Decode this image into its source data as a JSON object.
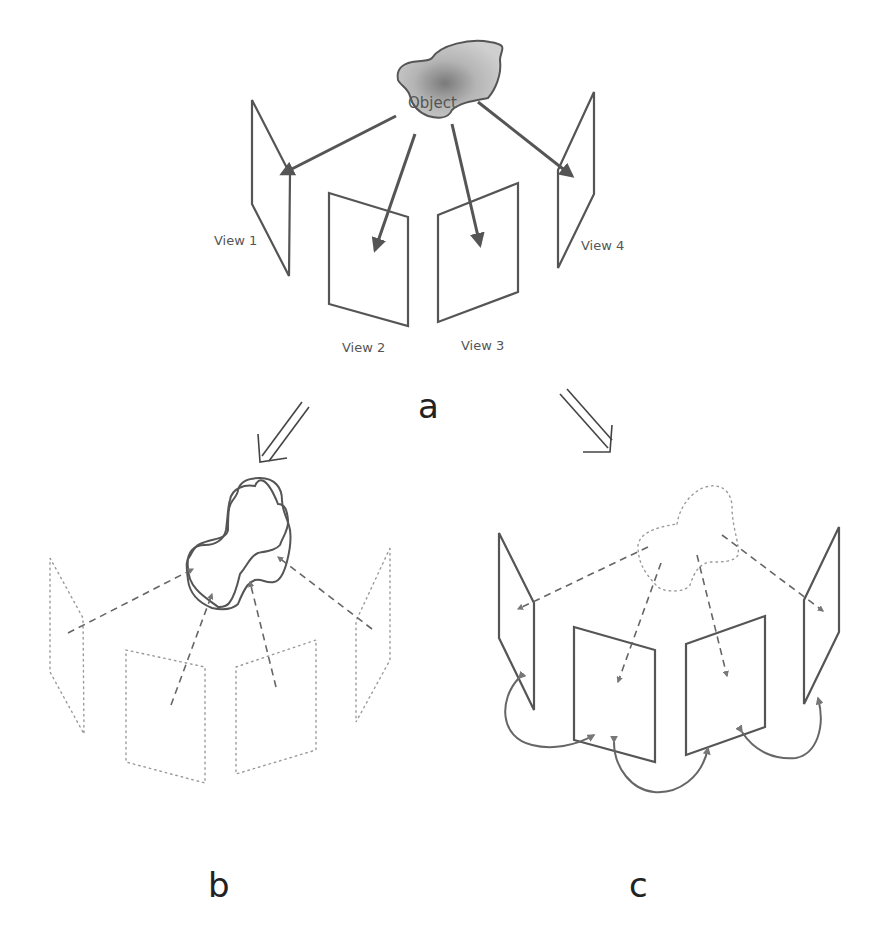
{
  "panels": {
    "a": {
      "label": "a",
      "object_label": "Object",
      "views": [
        "View 1",
        "View 2",
        "View 3",
        "View 4"
      ]
    },
    "b": {
      "label": "b"
    },
    "c": {
      "label": "c"
    }
  },
  "colors": {
    "background": "#ffffff",
    "stroke": "#555555",
    "object_fill": "#9a9a9a",
    "dotted": "#999999"
  }
}
